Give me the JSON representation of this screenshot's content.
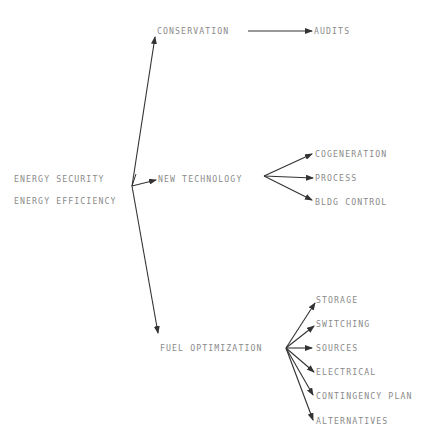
{
  "diagram": {
    "root": {
      "labels": [
        "ENERGY SECURITY",
        "ENERGY EFFICIENCY"
      ]
    },
    "branches": [
      {
        "label": "CONSERVATION",
        "children": [
          "AUDITS"
        ]
      },
      {
        "label": "NEW TECHNOLOGY",
        "children": [
          "COGENERATION",
          "PROCESS",
          "BLDG CONTROL"
        ]
      },
      {
        "label": "FUEL OPTIMIZATION",
        "children": [
          "STORAGE",
          "SWITCHING",
          "SOURCES",
          "ELECTRICAL",
          "CONTINGENCY PLAN",
          "ALTERNATIVES"
        ]
      }
    ],
    "colors": {
      "text": "#8a8a8a",
      "arrow": "#333333",
      "background": "#ffffff"
    }
  }
}
